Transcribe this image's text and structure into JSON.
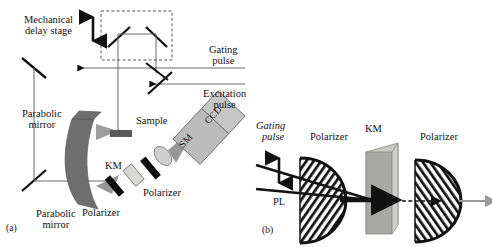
{
  "figure": {
    "panels": [
      {
        "id": "a",
        "panel_label": "(a)",
        "labels": {
          "mechanical_delay_stage": "Mechanical\ndelay stage",
          "mechanical_delay_stage_line1": "Mechanical",
          "mechanical_delay_stage_line2": "delay stage",
          "gating_pulse_line1": "Gating",
          "gating_pulse_line2": "pulse",
          "excitation_pulse_line1": "Excitation",
          "excitation_pulse_line2": "pulse",
          "parabolic_mirror_top_line1": "Parabolic",
          "parabolic_mirror_top_line2": "mirror",
          "parabolic_mirror_bottom_line1": "Parabolic",
          "parabolic_mirror_bottom_line2": "mirror",
          "sample": "Sample",
          "km": "KM",
          "polarizer_lower": "Polarizer",
          "polarizer_upper": "Polarizer",
          "spectrometer": "SM",
          "ccd": "CCD"
        }
      },
      {
        "id": "b",
        "panel_label": "(b)",
        "labels": {
          "gating_pulse_line1": "Gating",
          "gating_pulse_line2": "pulse",
          "pl": "PL",
          "polarizer_first": "Polarizer",
          "km": "KM",
          "polarizer_second": "Polarizer"
        }
      }
    ]
  },
  "colors": {
    "line": "#4a4a4a",
    "ink": "#111111",
    "parabolic_mirror": "#6e6e6e",
    "km_crystal": "#d8d8d4",
    "km_block_front": "#a8a8a4",
    "km_block_side": "#c9c9c4",
    "detector_box": "#bcbcbc",
    "beam_cone": "#8c8c8c",
    "sample_bar": "#5a5a5a",
    "polarizer_bar": "#0d0d0d",
    "output_arrow": "#9a9a9a",
    "background": "#ffffff"
  }
}
